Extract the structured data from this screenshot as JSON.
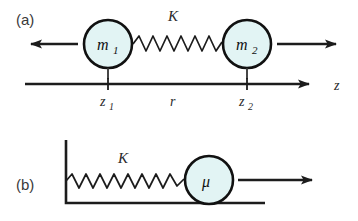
{
  "figure": {
    "type": "physics-diagram",
    "background_color": "#ffffff",
    "line_color": "#1c1c1c",
    "circle_fill": "#e2f4f4",
    "circle_stroke": "#111111"
  },
  "panel_a": {
    "label": "(a)",
    "mass_left": {
      "symbol": "m",
      "subscript": "1"
    },
    "mass_right": {
      "symbol": "m",
      "subscript": "2"
    },
    "spring_label": "K",
    "spring_coils": 9,
    "arrow_left": {
      "direction": "left",
      "name": "force-arrow-left"
    },
    "arrow_right": {
      "direction": "right",
      "name": "force-arrow-right"
    },
    "axis": {
      "name": "z-axis",
      "label": "z",
      "direction": "right",
      "ticks": [
        {
          "symbol": "z",
          "subscript": "1"
        },
        {
          "symbol": "z",
          "subscript": "2"
        }
      ],
      "separation_label": "r"
    }
  },
  "panel_b": {
    "label": "(b)",
    "mass": {
      "symbol": "μ",
      "subscript": ""
    },
    "spring_label": "K",
    "spring_coils": 9,
    "wall": "fixed-wall",
    "floor": "ground-line",
    "arrow_right": {
      "direction": "right",
      "name": "force-arrow-right"
    }
  }
}
